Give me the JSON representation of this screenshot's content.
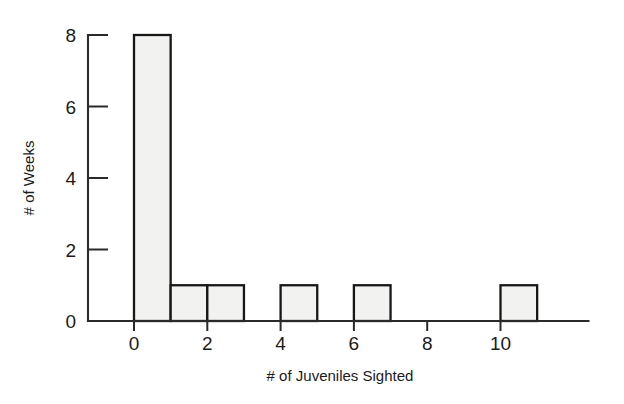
{
  "chart_data": {
    "type": "bar",
    "title": "",
    "subtitle": "",
    "xlabel": "# of Juveniles Sighted",
    "ylabel": "# of Weeks",
    "categories": [
      "0-1",
      "1-2",
      "2-3",
      "3-4",
      "4-5",
      "5-6",
      "6-7",
      "7-8",
      "8-9",
      "9-10",
      "10-11"
    ],
    "bin_starts": [
      0,
      1,
      2,
      3,
      4,
      5,
      6,
      7,
      8,
      9,
      10
    ],
    "bin_width": 1,
    "values": [
      8,
      1,
      1,
      0,
      1,
      0,
      1,
      0,
      0,
      0,
      1
    ],
    "xlim": [
      0,
      12.4
    ],
    "ylim": [
      0,
      8
    ],
    "x_ticks": [
      0,
      2,
      4,
      6,
      8,
      10
    ],
    "x_tick_labels": [
      "0",
      "2",
      "4",
      "6",
      "8",
      "10"
    ],
    "y_ticks": [
      0,
      2,
      4,
      6,
      8
    ],
    "y_tick_labels": [
      "0",
      "2",
      "4",
      "6",
      "8"
    ],
    "grid": false,
    "legend": false,
    "legend_position": "none",
    "bar_fill_color": "#f2f2f0",
    "bar_edge_color": "#171717",
    "axis_color": "#2a2a2a",
    "text_color": "#1b1b1b",
    "background_color": "#ffffff"
  },
  "axes": {
    "x_axis_label": "# of Juveniles Sighted",
    "y_axis_label": "# of Weeks"
  },
  "x_tick_labels": {
    "0": "0",
    "1": "2",
    "2": "4",
    "3": "6",
    "4": "8",
    "5": "10"
  },
  "y_tick_labels": {
    "0": "0",
    "1": "2",
    "2": "4",
    "3": "6",
    "4": "8"
  }
}
